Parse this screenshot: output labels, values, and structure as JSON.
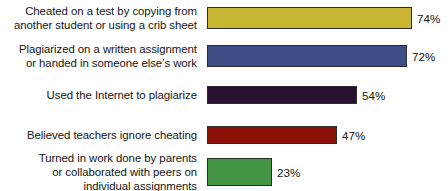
{
  "chart_data": {
    "type": "bar",
    "orientation": "horizontal",
    "title": "",
    "subtitle": "",
    "xlabel": "",
    "ylabel": "",
    "xlim": [
      0,
      100
    ],
    "grid": false,
    "legend": null,
    "value_suffix": "%",
    "categories": [
      "Cheated on a test by copying from\nanother student or using a crib sheet",
      "Plagiarized on a written assignment\nor handed in someone else’s work",
      "Used the Internet to plagiarize",
      "Believed teachers ignore cheating",
      "Turned in work done by parents\nor collaborated with peers on\nindividual assignments"
    ],
    "values": [
      74,
      72,
      54,
      47,
      23
    ],
    "value_labels": [
      "74%",
      "72%",
      "54%",
      "47%",
      "23%"
    ],
    "colors": [
      "#c9b734",
      "#3f4e86",
      "#2a1130",
      "#8b1007",
      "#449545"
    ],
    "bar_border_color": "#2b2b2b",
    "background_color": "#ffffff",
    "text_color": "#141414"
  },
  "bars": [
    {
      "label": "Cheated on a test by copying from\nanother student or using a crib sheet",
      "value_label": "74%",
      "value": 74,
      "color": "#c9b734",
      "top": 4,
      "height": 28,
      "width_px": 205
    },
    {
      "label": "Plagiarized on a written assignment\nor handed in someone else’s work",
      "value_label": "72%",
      "value": 72,
      "color": "#3f4e86",
      "top": 42,
      "height": 28,
      "width_px": 200
    },
    {
      "label": "Used the Internet to plagiarize",
      "value_label": "54%",
      "value": 54,
      "color": "#2a1130",
      "top": 83,
      "height": 24,
      "width_px": 150
    },
    {
      "label": "Believed teachers ignore cheating",
      "value_label": "47%",
      "value": 47,
      "color": "#8b1007",
      "top": 123,
      "height": 24,
      "width_px": 130
    },
    {
      "label": "Turned in work done by parents\nor collaborated with peers on\nindividual assignments",
      "value_label": "23%",
      "value": 23,
      "color": "#449545",
      "top": 155,
      "height": 34,
      "width_px": 65
    }
  ]
}
